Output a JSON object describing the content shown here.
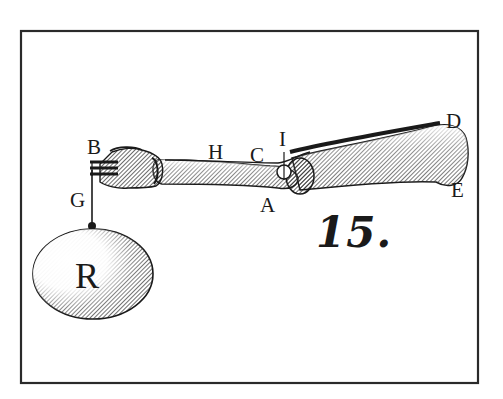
{
  "figure": {
    "number": "15.",
    "frame": {
      "stroke": "#2a2a2a",
      "background": "#ffffff"
    }
  },
  "labels": {
    "B": "B",
    "G": "G",
    "H": "H",
    "C": "C",
    "I": "I",
    "A": "A",
    "D": "D",
    "E": "E",
    "R": "R"
  },
  "parts": {
    "hand": "hand",
    "forearm": "forearm",
    "elbow_joint": "elbow joint",
    "upper_arm": "humerus",
    "cord": "cord",
    "weight": "weight"
  },
  "colors": {
    "ink": "#1a1a1a",
    "paper": "#ffffff",
    "shade": "#3a3a3a"
  }
}
